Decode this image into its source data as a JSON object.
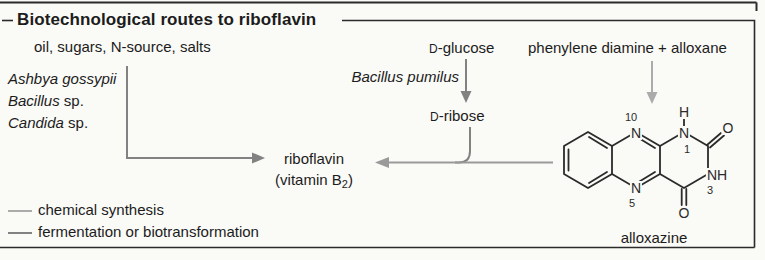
{
  "frame": {
    "title": "Biotechnological routes to riboflavin"
  },
  "feedstock": "oil, sugars, N-source, salts",
  "organisms": [
    {
      "name": "Ashbya gossypii",
      "suffix": ""
    },
    {
      "name": "Bacillus",
      "suffix": " sp."
    },
    {
      "name": "Candida",
      "suffix": " sp."
    }
  ],
  "glucose_route": {
    "substrate_cap": "D",
    "substrate_rest": "-glucose",
    "organism": "Bacillus pumilus",
    "intermediate_cap": "D",
    "intermediate_rest": "-ribose"
  },
  "chemical_route": {
    "reactants": "phenylene diamine + alloxane",
    "product_label": "alloxazine"
  },
  "product": {
    "name": "riboflavin",
    "alt_open": "(vitamin B",
    "alt_sub": "2",
    "alt_close": ")"
  },
  "structure": {
    "atoms": {
      "n10_num": "10",
      "n10": "N",
      "n1_h": "H",
      "n1": "N",
      "n1_num": "1",
      "o_top": "O",
      "n3h": "NH",
      "n3_num": "3",
      "n5": "N",
      "n5_num": "5",
      "o_bottom": "O"
    }
  },
  "legend": [
    {
      "label": "chemical synthesis",
      "color": "#ababab"
    },
    {
      "label": "fermentation or biotransformation",
      "color": "#828282"
    }
  ],
  "colors": {
    "chemical": "#ababab",
    "fermentation": "#828282",
    "merged": "#9a9a9a",
    "structure": "#2b2b2b",
    "frame": "#2b2b2b",
    "text": "#1c1c1c"
  }
}
